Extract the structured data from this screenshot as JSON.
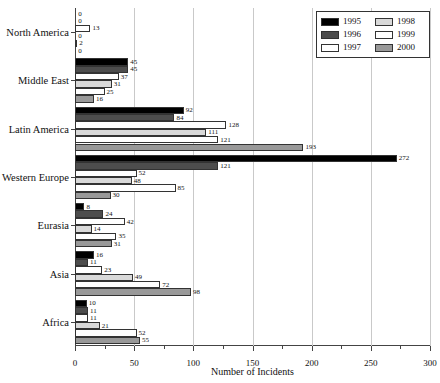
{
  "chart_data": {
    "type": "bar",
    "orientation": "horizontal",
    "title": "",
    "xlabel": "Number of Incidents",
    "ylabel": "",
    "xlim": [
      0,
      300
    ],
    "xticks": [
      0,
      50,
      100,
      150,
      200,
      250,
      300
    ],
    "xtick_labels": [
      "0",
      "50",
      "100",
      "150",
      "200",
      "250",
      "300"
    ],
    "grid": true,
    "legend_position": "top-right",
    "categories": [
      "North America",
      "Middle East",
      "Latin America",
      "Western Europe",
      "Eurasia",
      "Asia",
      "Africa"
    ],
    "series": [
      {
        "name": "1995",
        "color": "#000000",
        "values": [
          0,
          45,
          92,
          272,
          8,
          16,
          10
        ]
      },
      {
        "name": "1996",
        "color": "#4d4d4d",
        "values": [
          0,
          45,
          84,
          121,
          24,
          11,
          11
        ]
      },
      {
        "name": "1997",
        "color": "#ffffff",
        "values": [
          13,
          37,
          128,
          52,
          42,
          23,
          11
        ]
      },
      {
        "name": "1998",
        "color": "#d9d9d9",
        "values": [
          0,
          31,
          111,
          48,
          14,
          49,
          21
        ]
      },
      {
        "name": "1999",
        "color": "#ffffff",
        "values": [
          2,
          25,
          121,
          85,
          35,
          72,
          52
        ]
      },
      {
        "name": "2000",
        "color": "#999999",
        "values": [
          0,
          16,
          193,
          30,
          31,
          98,
          55
        ]
      }
    ]
  },
  "legend": {
    "entries": [
      {
        "label": "1995",
        "color": "#000000"
      },
      {
        "label": "1998",
        "color": "#d9d9d9"
      },
      {
        "label": "1996",
        "color": "#4d4d4d"
      },
      {
        "label": "1999",
        "color": "#ffffff"
      },
      {
        "label": "1997",
        "color": "#ffffff"
      },
      {
        "label": "2000",
        "color": "#999999"
      }
    ]
  }
}
